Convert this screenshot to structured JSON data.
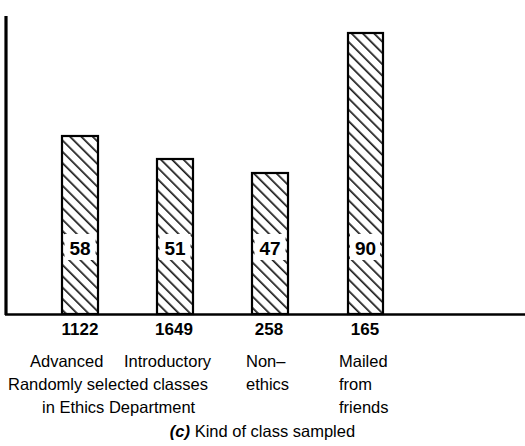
{
  "chart_data": {
    "type": "bar",
    "title": "",
    "caption_id": "(c)",
    "caption_text": "Kind of class sampled",
    "xlabel": "Kind of class sampled",
    "ylabel": "",
    "grid": false,
    "legend": "none",
    "ylim": [
      0,
      100
    ],
    "categories": [
      "Advanced",
      "Introductory",
      "Non-ethics",
      "Mailed from friends"
    ],
    "values": [
      58,
      51,
      47,
      90
    ],
    "value_labels": [
      "58",
      "51",
      "47",
      "90"
    ],
    "sample_sizes": [
      "1122",
      "1649",
      "258",
      "165"
    ],
    "bar_style": {
      "fill": "#ffffff",
      "edge": "#000000",
      "hatch": "/",
      "hatch_color": "#1a1a1a"
    },
    "axis_color": "#000000",
    "group_labels": {
      "row1": [
        "Advanced",
        "Introductory",
        "Non–",
        "Mailed"
      ],
      "row2": [
        "Randomly selected classes",
        "ethics",
        "from"
      ],
      "row3": [
        "in Ethics Department",
        "friends"
      ]
    },
    "annotations": [
      "Randomly selected classes in Ethics Department",
      "Non-ethics",
      "Mailed from friends"
    ]
  },
  "ticks": [
    {
      "label": "1122",
      "center": 80
    },
    {
      "label": "1649",
      "center": 174
    },
    {
      "label": "258",
      "center": 269
    },
    {
      "label": "165",
      "center": 365
    }
  ],
  "desc": {
    "row1": [
      {
        "text": "Advanced",
        "left": 30
      },
      {
        "text": "Introductory",
        "left": 124
      },
      {
        "text": "Non–",
        "left": 246
      },
      {
        "text": "Mailed",
        "left": 339
      }
    ],
    "row2": [
      {
        "text": "Randomly selected classes",
        "left": 8
      },
      {
        "text": "ethics",
        "left": 246
      },
      {
        "text": "from",
        "left": 339
      }
    ],
    "row3": [
      {
        "text": "in Ethics Department",
        "left": 42
      },
      {
        "text": "friends",
        "left": 339
      }
    ]
  },
  "bars": [
    {
      "value": 58,
      "label": "58",
      "x": 62,
      "width": 36,
      "top": 136
    },
    {
      "value": 51,
      "label": "51",
      "x": 157,
      "width": 36,
      "top": 159
    },
    {
      "value": 47,
      "label": "47",
      "x": 252,
      "width": 36,
      "top": 173
    },
    {
      "value": 90,
      "label": "90",
      "x": 348,
      "width": 35,
      "top": 33
    }
  ],
  "axes": {
    "baseline_y": 314,
    "y_axis_x": 5,
    "y_axis_top": 16,
    "baseline_x_start": 5,
    "baseline_x_end": 525
  }
}
